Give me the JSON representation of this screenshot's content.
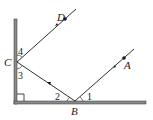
{
  "diagram": {
    "type": "geometry-reflection",
    "points": {
      "A": "A",
      "B": "B",
      "C": "C",
      "D": "D"
    },
    "angles": {
      "angle1": "1",
      "angle2": "2",
      "angle3": "3",
      "angle4": "4"
    },
    "colors": {
      "line": "#1a1a1a",
      "wall": "#6e6e6e"
    }
  }
}
